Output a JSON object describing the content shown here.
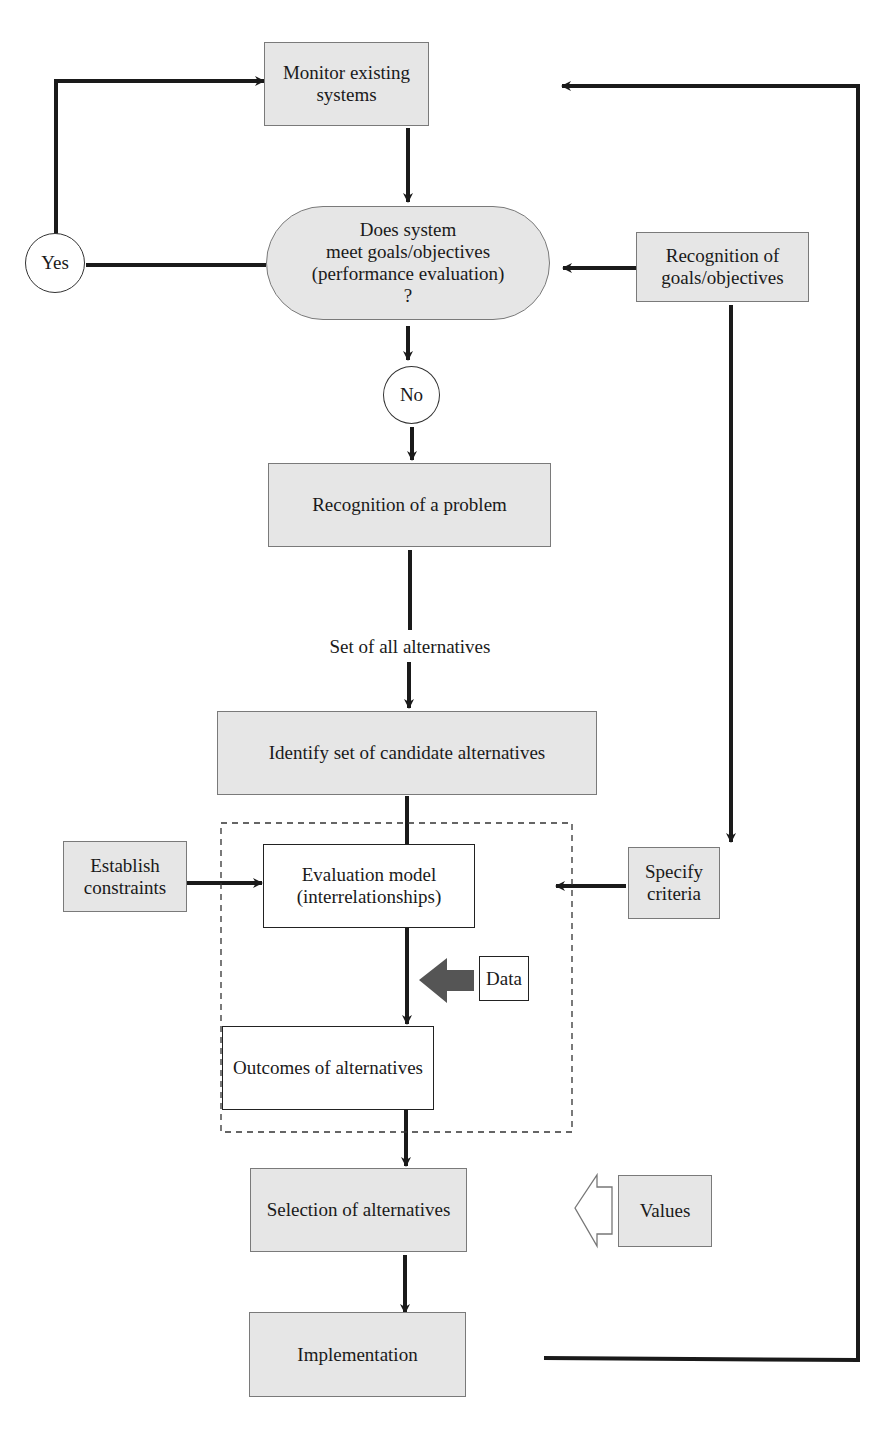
{
  "diagram": {
    "type": "flowchart",
    "nodes": {
      "monitor": {
        "label": "Monitor existing systems",
        "shape": "rect",
        "fill": "#e6e6e6"
      },
      "decision": {
        "label": "Does system\nmeet goals/objectives\n(performance evaluation)\n?",
        "shape": "rounded",
        "fill": "#e6e6e6"
      },
      "yes": {
        "label": "Yes",
        "shape": "circle"
      },
      "no": {
        "label": "No",
        "shape": "circle"
      },
      "recognition_goals": {
        "label": "Recognition of\ngoals/objectives",
        "shape": "rect",
        "fill": "#e6e6e6"
      },
      "recognition_problem": {
        "label": "Recognition of a problem",
        "shape": "rect",
        "fill": "#e6e6e6"
      },
      "set_all": {
        "label": "Set of all alternatives",
        "shape": "text"
      },
      "identify": {
        "label": "Identify set of candidate alternatives",
        "shape": "rect",
        "fill": "#e6e6e6"
      },
      "constraints": {
        "label": "Establish\nconstraints",
        "shape": "rect",
        "fill": "#e6e6e6"
      },
      "eval_model": {
        "label": "Evaluation model\n(interrelationships)",
        "shape": "rect",
        "fill": "#ffffff"
      },
      "criteria": {
        "label": "Specify\ncriteria",
        "shape": "rect",
        "fill": "#e6e6e6"
      },
      "data": {
        "label": "Data",
        "shape": "rect",
        "fill": "#ffffff"
      },
      "outcomes": {
        "label": "Outcomes of alternatives",
        "shape": "rect",
        "fill": "#ffffff"
      },
      "selection": {
        "label": "Selection of alternatives",
        "shape": "rect",
        "fill": "#e6e6e6"
      },
      "values": {
        "label": "Values",
        "shape": "rect",
        "fill": "#e6e6e6"
      },
      "implementation": {
        "label": "Implementation",
        "shape": "rect",
        "fill": "#e6e6e6"
      }
    },
    "edges": [
      [
        "monitor",
        "decision"
      ],
      [
        "decision",
        "yes"
      ],
      [
        "yes",
        "monitor"
      ],
      [
        "recognition_goals",
        "decision"
      ],
      [
        "decision",
        "no"
      ],
      [
        "no",
        "recognition_problem"
      ],
      [
        "recognition_problem",
        "identify"
      ],
      [
        "identify",
        "eval_model"
      ],
      [
        "recognition_goals",
        "criteria"
      ],
      [
        "constraints",
        "eval_model"
      ],
      [
        "criteria",
        "eval_model"
      ],
      [
        "data",
        "eval_model->outcomes"
      ],
      [
        "eval_model",
        "outcomes"
      ],
      [
        "outcomes",
        "selection"
      ],
      [
        "values",
        "selection"
      ],
      [
        "selection",
        "implementation"
      ],
      [
        "implementation",
        "monitor"
      ]
    ],
    "colors": {
      "box_fill": "#e6e6e6",
      "line": "#1a1a1a",
      "data_arrow": "#555555"
    }
  }
}
